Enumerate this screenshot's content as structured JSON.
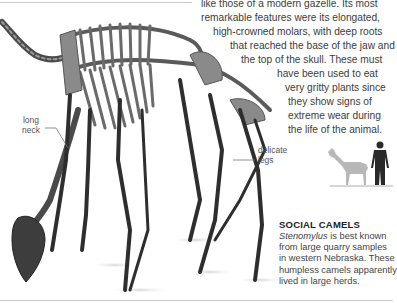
{
  "article": {
    "body_lines": [
      "like those of a modern gazelle. Its most",
      "remarkable features were its elongated,",
      "high-crowned molars, with deep roots",
      "that reached the base of the jaw and",
      "the top of the skull. These must",
      "have been used to eat",
      "very gritty plants since",
      "they show signs of",
      "extreme wear during",
      "the life of the animal."
    ]
  },
  "annotations": {
    "neck_label_1": "long",
    "neck_label_2": "neck",
    "legs_label_1": "delicate",
    "legs_label_2": "legs"
  },
  "scale_figure": {
    "animal": "camel-silhouette",
    "human": "human-silhouette",
    "animal_color": "#b8b8b8",
    "human_color": "#2a2a2a"
  },
  "sidebar": {
    "heading": "SOCIAL CAMELS",
    "genus": "Stenomylus",
    "line1_rest": " is best known",
    "lines": [
      "from large quarry samples",
      "in western Nebraska. These",
      "humpless camels apparently",
      "lived in large herds."
    ]
  },
  "image": {
    "subject": "Stenomylus skeleton",
    "skeleton_color": "#3a3a3a"
  }
}
